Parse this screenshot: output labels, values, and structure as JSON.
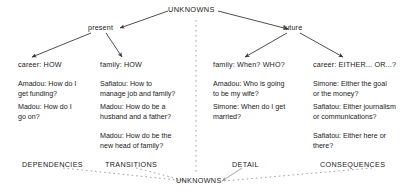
{
  "diagram": {
    "root": {
      "label": "UNKNOWNS"
    },
    "bottom_root": {
      "label": "UNKNOWNS"
    },
    "branches": [
      {
        "label": "present"
      },
      {
        "label": "future"
      }
    ],
    "columns": [
      {
        "heading": "career: HOW",
        "footer": "DEPENDENCIES",
        "entries": [
          "Amadou: How do I\nget funding?",
          "Madou: How do I\ngo on?"
        ]
      },
      {
        "heading": "family: HOW",
        "footer": "TRANSITIONS",
        "entries": [
          "Safiatou: How to\nmanage job and family?",
          "Madou: How do be a\nhusband and a father?",
          "Madou: How do be the\nnew head of family?"
        ]
      },
      {
        "heading": "family: When? WHO?",
        "footer": "DETAIL",
        "entries": [
          "Amadou: Who is going\nto be my wife?",
          "Simone: When do I get\nmarried?"
        ]
      },
      {
        "heading": "career: EITHER... OR...?",
        "footer": "CONSEQUENCES",
        "entries": [
          "Simone: Either the goal\nor the money?",
          "Safiatou: Either journalism\nor communications?",
          "Safiatou: Either here or\nthere?"
        ]
      }
    ],
    "colors": {
      "line": "#3a3a3a",
      "dashed": "#8a8a8a",
      "text": "#1a1a1a",
      "background": "#ffffff"
    }
  }
}
